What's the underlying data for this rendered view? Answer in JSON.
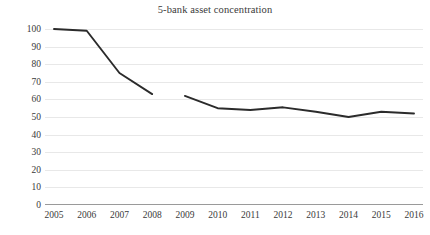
{
  "chart_data": {
    "type": "line",
    "title": "5-bank asset concentration",
    "xlabel": "",
    "ylabel": "",
    "categories": [
      "2005",
      "2006",
      "2007",
      "2008",
      "2009",
      "2010",
      "2011",
      "2012",
      "2013",
      "2014",
      "2015",
      "2016"
    ],
    "x": [
      2005,
      2006,
      2007,
      2008,
      2009,
      2010,
      2011,
      2012,
      2013,
      2014,
      2015,
      2016
    ],
    "series": [
      {
        "name": "5-bank asset concentration (2005-2008)",
        "x": [
          2005,
          2006,
          2007,
          2008
        ],
        "values": [
          100,
          99,
          75,
          63
        ]
      },
      {
        "name": "5-bank asset concentration (2009-2016)",
        "x": [
          2009,
          2010,
          2011,
          2012,
          2013,
          2014,
          2015,
          2016
        ],
        "values": [
          62,
          55,
          54,
          55.5,
          53,
          50,
          53,
          52
        ]
      }
    ],
    "ylim": [
      0,
      100
    ],
    "ytick_values": [
      0,
      10,
      20,
      30,
      40,
      50,
      60,
      70,
      80,
      90,
      100
    ],
    "ytick_labels": [
      "0",
      "10",
      "20",
      "30",
      "40",
      "50",
      "60",
      "70",
      "80",
      "90",
      "100"
    ],
    "grid": true,
    "grid_axis": "y",
    "legend": false,
    "legend_position": "none",
    "line_color": "#2b2b2b",
    "grid_color": "#e8e8e8",
    "axis_color": "#9a9a9a",
    "background_color": "#ffffff",
    "text_color": "#3a3a3a"
  }
}
